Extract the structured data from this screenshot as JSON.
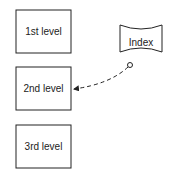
{
  "diagram": {
    "boxes": [
      {
        "label": "1st level"
      },
      {
        "label": "2nd level"
      },
      {
        "label": "3rd level"
      }
    ],
    "index": {
      "label": "Index",
      "shape": "storage-cylinder"
    },
    "connector": {
      "from": "Index",
      "to": "2nd level",
      "style": "dashed",
      "start": "circle",
      "end": "arrow"
    }
  }
}
